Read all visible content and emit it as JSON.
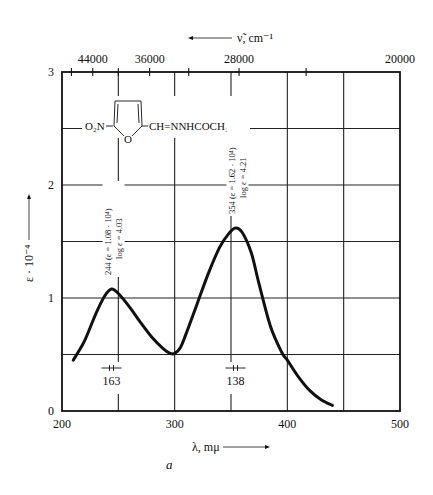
{
  "chart_data": {
    "type": "line",
    "title": "",
    "panel_label": "a",
    "xlabel": "λ, mμ",
    "ylabel": "ε · 10⁻⁴",
    "x2label": "ν̃, cm⁻¹",
    "xlim": [
      200,
      500
    ],
    "ylim": [
      0,
      3
    ],
    "grid": true,
    "x_ticks": [
      200,
      300,
      400,
      500
    ],
    "y_ticks": [
      0,
      1,
      2,
      3
    ],
    "x_grid": [
      200,
      250,
      300,
      350,
      400,
      450,
      500
    ],
    "y_grid": [
      0,
      0.5,
      1,
      1.5,
      2,
      2.5,
      3
    ],
    "x2_ticks_labeled": [
      44000,
      36000,
      28000,
      20000
    ],
    "x2_ticks_minor": [
      48000,
      40000,
      32000,
      24000
    ],
    "structure": {
      "left_group": "O₂N",
      "ring_heteroatom": "O",
      "substituent": "CH=NNHCOCH₂CN"
    },
    "series": [
      {
        "name": "absorption",
        "x": [
          210,
          220,
          230,
          238,
          244,
          250,
          260,
          270,
          280,
          290,
          296,
          300,
          305,
          310,
          320,
          330,
          340,
          348,
          354,
          360,
          368,
          375,
          385,
          395,
          400,
          410,
          420,
          430,
          440
        ],
        "y": [
          0.45,
          0.62,
          0.86,
          1.02,
          1.08,
          1.04,
          0.92,
          0.78,
          0.65,
          0.55,
          0.51,
          0.51,
          0.56,
          0.68,
          0.95,
          1.22,
          1.45,
          1.57,
          1.62,
          1.58,
          1.4,
          1.12,
          0.75,
          0.52,
          0.45,
          0.3,
          0.18,
          0.1,
          0.05
        ]
      }
    ],
    "annotations": [
      {
        "x": 244,
        "line1": "244 (ε = 1.08 · 10⁴)",
        "line2": "log ε = 4.03"
      },
      {
        "x": 354,
        "line1": "354 (ε = 1.62 · 10⁴)",
        "line2": "log ε = 4.21"
      }
    ],
    "bandwidths": [
      {
        "x": 244,
        "label": "163"
      },
      {
        "x": 354,
        "label": "138"
      }
    ]
  },
  "labels": {
    "x2_title": "ν̃, cm⁻¹",
    "x_title": "λ, mμ",
    "y_title": "ε · 10⁻⁴",
    "panel": "a",
    "formula_left": "O₂N",
    "formula_ring_o": "O",
    "formula_right": "CH=NNHCOCH₂CN"
  }
}
